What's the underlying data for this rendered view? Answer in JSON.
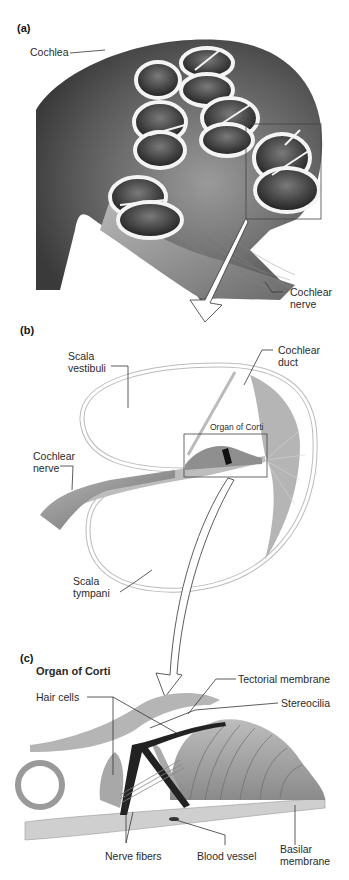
{
  "figure": {
    "panels": [
      {
        "id": "a",
        "label": "(a)"
      },
      {
        "id": "b",
        "label": "(b)"
      },
      {
        "id": "c",
        "label": "(c)"
      }
    ],
    "panel_a": {
      "labels": {
        "cochlea": "Cochlea",
        "cochlear_nerve": "Cochlear\nnerve"
      }
    },
    "panel_b": {
      "labels": {
        "scala_vestibuli": "Scala\nvestibuli",
        "cochlear_duct": "Cochlear\nduct",
        "organ_of_corti": "Organ of Corti",
        "cochlear_nerve": "Cochlear\nnerve",
        "scala_tympani": "Scala\ntympani"
      }
    },
    "panel_c": {
      "title": "Organ of Corti",
      "labels": {
        "tectorial_membrane": "Tectorial membrane",
        "hair_cells": "Hair cells",
        "stereocilia": "Stereocilia",
        "nerve_fibers": "Nerve fibers",
        "blood_vessel": "Blood vessel",
        "basilar_membrane": "Basilar\nmembrane"
      }
    },
    "colors": {
      "background": "#ffffff",
      "tissue_dark": "#3a3a3a",
      "tissue_mid": "#8c8c8c",
      "tissue_light": "#cfcfcf",
      "bone": "#eeeeee",
      "leader_line": "#333333"
    }
  }
}
